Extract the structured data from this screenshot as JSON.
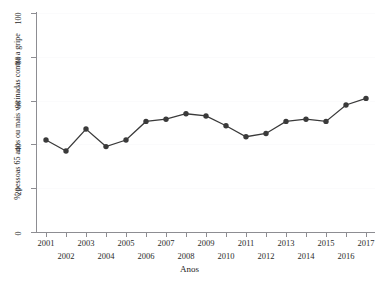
{
  "figure": {
    "title_fragment": "",
    "background_color": "#ffffff",
    "line_color": "#3a3a3a",
    "marker_color": "#3a3a3a",
    "axis_color": "#8d8d92",
    "grid_color": "#fbfbfc"
  },
  "chart_data": {
    "type": "line",
    "title": "",
    "xlabel": "Anos",
    "ylabel": "% pessoas 65 anos ou mais vacinadas contra a gripe",
    "categories": [
      "2001",
      "2002",
      "2003",
      "2004",
      "2005",
      "2006",
      "2007",
      "2008",
      "2009",
      "2010",
      "2011",
      "2012",
      "2013",
      "2014",
      "2015",
      "2016",
      "2017"
    ],
    "values": [
      42,
      37,
      47,
      39,
      42,
      50.5,
      51.5,
      54,
      53,
      48.5,
      43.5,
      45,
      50.5,
      51.5,
      50.5,
      58,
      61
    ],
    "series": [
      {
        "name": "% pessoas 65 anos ou mais vacinadas contra a gripe",
        "values": [
          42,
          37,
          47,
          39,
          42,
          50.5,
          51.5,
          54,
          53,
          48.5,
          43.5,
          45,
          50.5,
          51.5,
          50.5,
          58,
          61
        ]
      }
    ],
    "ylim": [
      0,
      100
    ],
    "yticks": [
      0,
      20,
      40,
      60,
      80,
      100
    ],
    "ytick_labels": [
      "0",
      "20",
      "40",
      "60",
      "80",
      "100"
    ],
    "xticks": [
      "2001",
      "2002",
      "2003",
      "2004",
      "2005",
      "2006",
      "2007",
      "2008",
      "2009",
      "2010",
      "2011",
      "2012",
      "2013",
      "2014",
      "2015",
      "2016",
      "2017"
    ],
    "xtick_rows": {
      "top": [
        "2001",
        "2003",
        "2005",
        "2007",
        "2009",
        "2011",
        "2013",
        "2015",
        "2017"
      ],
      "bottom": [
        "2002",
        "2004",
        "2006",
        "2008",
        "2010",
        "2012",
        "2014",
        "2016"
      ]
    },
    "grid": "horizontal-faint",
    "legend": "none",
    "marker": "filled-circle"
  }
}
